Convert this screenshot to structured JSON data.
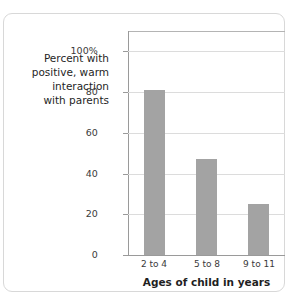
{
  "chart_data": {
    "type": "bar",
    "title": "",
    "subtitle": "",
    "categories": [
      "2 to 4",
      "5 to 8",
      "9 to 11"
    ],
    "values": [
      81,
      47,
      25
    ],
    "series": [
      {
        "name": "Percent with positive, warm interaction with parents",
        "values": [
          81,
          47,
          25
        ]
      }
    ],
    "xlabel": "Ages of child in years",
    "ylabel": "Percent with positive, warm interaction with parents",
    "ylabel_lines": [
      "Percent with",
      "positive, warm",
      "interaction",
      "with parents"
    ],
    "ylim": [
      0,
      110
    ],
    "yticks": [
      0,
      20,
      40,
      60,
      80,
      100
    ],
    "ytick_labels": [
      "0",
      "20",
      "40",
      "60",
      "80",
      "100%"
    ],
    "grid": true,
    "grid_axis": "y",
    "legend": false,
    "legend_position": "none",
    "bar_color": "#a3a3a3",
    "gridline_color": "#dcdcdc",
    "axis_color": "#9a9a9a",
    "text_color": "#1f1f1f",
    "background_color": "#ffffff",
    "border_color": "#d8d8d8"
  }
}
